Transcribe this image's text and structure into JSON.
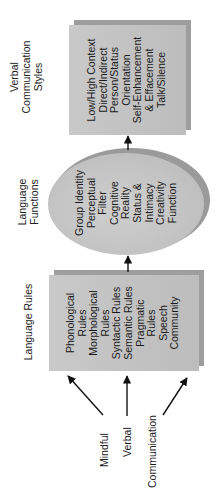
{
  "orientation": "rotated-90-ccw",
  "colors": {
    "box_fill": "#c4c4c4",
    "box_edge": "#9e9e9e",
    "ellipse_fill": "#c2c2c2",
    "arrow": "#111111",
    "text": "#1a1a1a"
  },
  "drivers": {
    "items": [
      {
        "label": "Mindful"
      },
      {
        "label": "Verbal"
      },
      {
        "label": "Communication"
      }
    ]
  },
  "language_rules": {
    "heading": "Language Rules",
    "items": [
      "Phonological",
      "Rules",
      "Morphological",
      "Rules",
      "Syntactic Rules",
      "Semantic Rules",
      "Pragmatic",
      "Rules",
      "Speech",
      "Community"
    ]
  },
  "language_functions": {
    "heading_line1": "Language",
    "heading_line2": "Functions",
    "items": [
      "Group Identity",
      "Perceptual",
      "Filter",
      "Cognitive",
      "Reality",
      "Status &",
      "Intimacy",
      "Creativity",
      "Function"
    ]
  },
  "verbal_styles": {
    "heading_line1": "Verbal",
    "heading_line2": "Communication",
    "heading_line3": "Styles",
    "items": [
      "Low/High Context",
      "Direct/Indirect",
      "Person/Status",
      "Orientation",
      "Self-Enhancement",
      "& Effacement",
      "Talk/Silence"
    ]
  }
}
